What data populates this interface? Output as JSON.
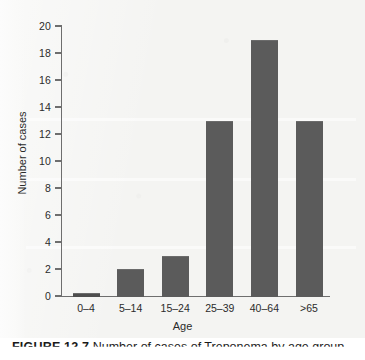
{
  "figure": {
    "caption_label": "FIGURE 12.7",
    "caption_text": "Number of cases of Treponema by age group",
    "background_color": "#f4f4f2",
    "bar_color": "#5b5b5b",
    "axis_color": "#6e6e6e",
    "text_color": "#2b2b2b"
  },
  "chart_data": {
    "type": "bar",
    "title": "",
    "xlabel": "Age",
    "ylabel": "Number of cases",
    "categories": [
      "0–4",
      "5–14",
      "15–24",
      "25–39",
      "40–64",
      ">65"
    ],
    "values": [
      0,
      2,
      3,
      13,
      19,
      13
    ],
    "ylim": [
      0,
      20
    ],
    "ytick_values": [
      0,
      2,
      4,
      6,
      8,
      10,
      12,
      14,
      16,
      18,
      20
    ],
    "ytick_labels": [
      "0",
      "2",
      "4",
      "6",
      "8",
      "10",
      "12",
      "14",
      "16",
      "18",
      "20"
    ],
    "grid": false,
    "legend": false,
    "legend_position": "none",
    "orientation": "vertical",
    "series": [
      {
        "name": "Number of cases",
        "values": [
          0,
          2,
          3,
          13,
          19,
          13
        ]
      }
    ]
  }
}
